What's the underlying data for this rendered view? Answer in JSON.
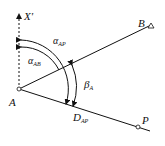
{
  "diagram": {
    "points": {
      "A": {
        "label": "A",
        "x": 19,
        "y": 89
      },
      "B": {
        "label": "B",
        "x": 151,
        "y": 25
      },
      "P": {
        "label": "P",
        "x": 138,
        "y": 127
      }
    },
    "axis": {
      "label": "X'",
      "sub": ""
    },
    "angles": {
      "alpha_AP": {
        "symbol": "α",
        "sub": "AP"
      },
      "alpha_AB": {
        "symbol": "α",
        "sub": "AB"
      },
      "beta_A": {
        "symbol": "β",
        "sub": "A"
      }
    },
    "distance": {
      "symbol": "D",
      "sub": "AP"
    },
    "colors": {
      "stroke": "#111111",
      "background": "#ffffff"
    }
  }
}
